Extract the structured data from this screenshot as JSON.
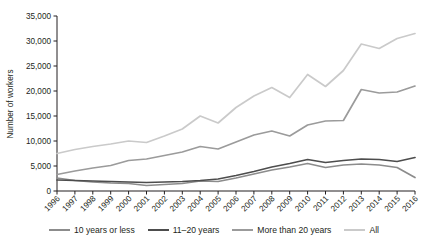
{
  "chart_data": {
    "type": "line",
    "title": "",
    "xlabel": "",
    "ylabel": "Number of workers",
    "x": [
      1996,
      1997,
      1998,
      1999,
      2000,
      2001,
      2002,
      2003,
      2004,
      2005,
      2006,
      2007,
      2008,
      2009,
      2010,
      2011,
      2012,
      2013,
      2014,
      2015,
      2016
    ],
    "categories": [
      "1996",
      "1997",
      "1998",
      "1999",
      "2000",
      "2001",
      "2002",
      "2003",
      "2004",
      "2005",
      "2006",
      "2007",
      "2008",
      "2009",
      "2010",
      "2011",
      "2012",
      "2013",
      "2014",
      "2015",
      "2016"
    ],
    "xlim": [
      1996,
      2016
    ],
    "ylim": [
      0,
      35000
    ],
    "yticks": [
      0,
      5000,
      10000,
      15000,
      20000,
      25000,
      30000,
      35000
    ],
    "ytick_labels": [
      "0",
      "5,000",
      "10,000",
      "15,000",
      "20,000",
      "25,000",
      "30,000",
      "35,000"
    ],
    "grid": false,
    "legend_position": "bottom",
    "series": [
      {
        "name": "10 years or less",
        "color": "#8c8c8c",
        "values": [
          2600,
          2100,
          1800,
          1600,
          1500,
          1100,
          1300,
          1500,
          2000,
          1900,
          2600,
          3400,
          4200,
          4800,
          5500,
          4700,
          5200,
          5400,
          5200,
          4700,
          2700
        ]
      },
      {
        "name": "11–20 years",
        "color": "#4d4d4d",
        "values": [
          2200,
          2100,
          2000,
          1900,
          1800,
          1700,
          1800,
          1900,
          2100,
          2400,
          3100,
          3900,
          4800,
          5500,
          6300,
          5700,
          6100,
          6400,
          6300,
          5900,
          6700
        ]
      },
      {
        "name": "More than 20 years",
        "color": "#9b9b9b",
        "values": [
          3300,
          4000,
          4600,
          5100,
          6100,
          6400,
          7100,
          7800,
          8900,
          8400,
          9800,
          11200,
          12000,
          11000,
          13200,
          14000,
          14100,
          20300,
          19600,
          19800,
          21000
        ]
      },
      {
        "name": "All",
        "color": "#cacaca",
        "values": [
          7500,
          8300,
          8900,
          9400,
          10000,
          9700,
          11000,
          12400,
          15000,
          13600,
          16700,
          19000,
          20700,
          18700,
          23300,
          20900,
          24100,
          29400,
          28500,
          30500,
          31500
        ]
      }
    ]
  },
  "legend": {
    "items": [
      {
        "label": "10 years or less",
        "color": "#8c8c8c"
      },
      {
        "label": "11–20 years",
        "color": "#4d4d4d"
      },
      {
        "label": "More than 20 years",
        "color": "#9b9b9b"
      },
      {
        "label": "All",
        "color": "#cacaca"
      }
    ]
  }
}
